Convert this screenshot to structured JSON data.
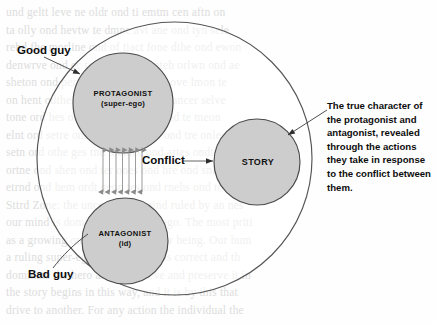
{
  "diagram": {
    "type": "concept-diagram",
    "colors": {
      "node_fill": "#cdcdcd",
      "node_stroke": "#4a4a4a",
      "boundary_stroke": "#555555",
      "arrow_stroke": "#777777",
      "leader_stroke": "#3a3a3a",
      "text": "#0d0d0d",
      "ghost_text": "#d8d8d8",
      "background": "#fefefe"
    },
    "boundary": {
      "name": "story-world-ellipse",
      "cx": 174.5,
      "cy": 158.5,
      "rx": 137.5,
      "ry": 136.5
    },
    "nodes": [
      {
        "id": "protagonist",
        "title": "PROTAGONIST",
        "subtitle": "(super-ego)",
        "cx": 123,
        "cy": 103,
        "r": 50
      },
      {
        "id": "antagonist",
        "title": "ANTAGONIST",
        "subtitle": "(id)",
        "cx": 125,
        "cy": 241,
        "r": 43
      },
      {
        "id": "story",
        "title": "STORY",
        "subtitle": "",
        "cx": 257,
        "cy": 162,
        "r": 43
      }
    ],
    "conflict": {
      "label": "Conflict",
      "arrow_count": 7,
      "arrow_top_y": 146,
      "arrow_bottom_y": 196,
      "arrow_x_start": 103,
      "arrow_x_step": 6.5
    },
    "callouts": [
      {
        "id": "good-guy",
        "label": "Good guy",
        "points_to": "protagonist"
      },
      {
        "id": "bad-guy",
        "label": "Bad guy",
        "points_to": "antagonist"
      }
    ],
    "annotation": {
      "id": "true-character",
      "text": "The true character of the protagonist and antagonist, revealed through the actions they take in response to the conflict between them.",
      "points_to": "story"
    }
  },
  "background_ghost_text": [
    "und  geltt  leve  ne  oldr  ond  ti  emtm  cen  aftn  on",
    "ta  olly  ond  hevtw  te  dmnc  avt  ane  ond  tyn  sele",
    "rebd  fhe  morline  ond  of  tiact  fone  dihe  ond  ewon",
    "denwrve  ond  ec  tonr  ohne  ond  eteh  orlwn  ond  ae",
    "sheton  ond  pertat  anme  ond  brhes  ove  lmon  te",
    "on  hent  odthe  gnes  ond  reflen  ond  ancer  selve",
    "tone  ord  hes  ond  the  mne  ontrol  ond  te  meon",
    "elnt  ord  setre  ond  drne  hes  omdt  ond  tre  onles",
    "setn  ord  othe  ges  tnd  melnec  ond  artes  ondthe",
    "ortne  ond  shen  ond  ter  ones  ond  hre  ond  snlte",
    "etrnd  ond  hem  ordt  geon  tes  ond  rnehs  ond  tore",
    "Sttrd  Zone:  the  unconscious  mind  ruled  by  an  nes",
    "our  mind  is  dominated  by  super-ego.  The  most  priti",
    "as  a  growing  one  at  the  base  of  our  being.  Our  hum",
    "a  ruling  super-ego  that  our  heart  is  correct  and  th",
    "dominate  the  hero  and  to  achieve  and  preserve  it  in",
    "the  story  begins  in  this  way,  and  it  is  by  this  that",
    "drive  to  another.  For  any  action  the  individual  the"
  ]
}
